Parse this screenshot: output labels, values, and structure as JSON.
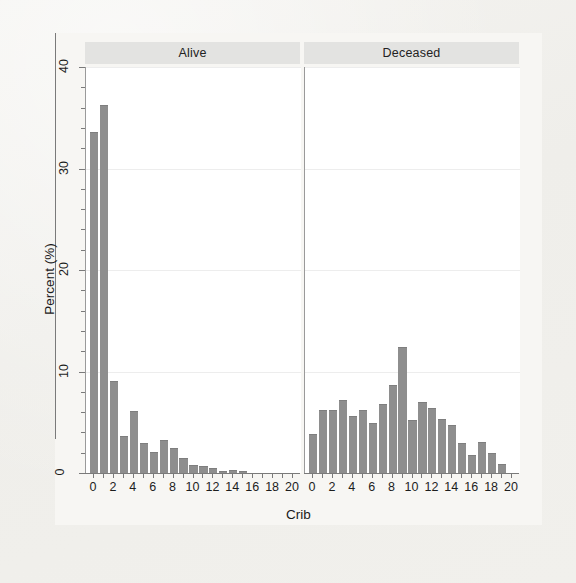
{
  "figure": {
    "y_axis_title": "Percent (%)",
    "x_axis_title": "Crib",
    "bar_color": "#8e8e8e",
    "strip_color": "#e3e3e1",
    "panel_color": "#ffffff",
    "background_color": "#f2f1ee"
  },
  "panels": [
    {
      "label": "Alive"
    },
    {
      "label": "Deceased"
    }
  ],
  "y_ticks": [
    "0",
    "10",
    "20",
    "30",
    "40"
  ],
  "x_ticks": [
    "0",
    "2",
    "4",
    "6",
    "8",
    "10",
    "12",
    "14",
    "16",
    "18",
    "20"
  ],
  "chart_data": {
    "type": "bar",
    "title": "",
    "subtitle": "",
    "xlabel": "Crib",
    "ylabel": "Percent (%)",
    "xlim": [
      -0.8,
      20.8
    ],
    "ylim": [
      0,
      40
    ],
    "grid": true,
    "legend": "none",
    "facet_by": "vital status",
    "categories": [
      0,
      1,
      2,
      3,
      4,
      5,
      6,
      7,
      8,
      9,
      10,
      11,
      12,
      13,
      14,
      15,
      16,
      17,
      18,
      19,
      20
    ],
    "series": [
      {
        "name": "Alive",
        "values": [
          33.5,
          36.2,
          9.0,
          3.5,
          6.0,
          2.9,
          2.0,
          3.2,
          2.4,
          1.4,
          0.7,
          0.6,
          0.4,
          0.1,
          0.2,
          0.1,
          0.0,
          0.0,
          0.0,
          0.0,
          0.0
        ]
      },
      {
        "name": "Deceased",
        "values": [
          3.7,
          6.1,
          6.1,
          7.1,
          5.5,
          6.1,
          4.8,
          6.7,
          8.6,
          12.3,
          5.1,
          6.9,
          6.3,
          5.2,
          4.6,
          2.9,
          1.7,
          3.0,
          1.9,
          0.8,
          0.0
        ]
      }
    ]
  }
}
